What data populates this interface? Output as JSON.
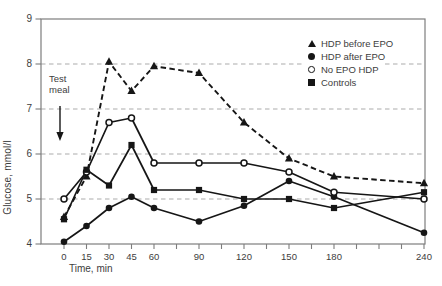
{
  "chart_data": {
    "type": "line",
    "title": "",
    "xlabel": "Time, min",
    "ylabel": "Glucose, mmol/l",
    "xlim": [
      0,
      240
    ],
    "ylim": [
      4,
      9
    ],
    "y_ticks": [
      4,
      5,
      6,
      7,
      8,
      9
    ],
    "x_ticks": {
      "labeled": [
        0,
        15,
        30,
        45,
        60,
        90,
        120,
        150,
        180,
        240
      ],
      "minor": [
        75,
        105,
        135,
        165,
        195,
        210,
        225
      ]
    },
    "gridlines_at": [
      5,
      6,
      7,
      8
    ],
    "grid_style": "dashed",
    "legend_position": "top-right",
    "annotation": {
      "text": "Test meal",
      "arrow": "down"
    },
    "x": [
      0,
      15,
      30,
      45,
      60,
      90,
      120,
      150,
      180,
      240
    ],
    "series": [
      {
        "name": "HDP before EPO",
        "marker": "filled-triangle",
        "line": "dashed",
        "values": [
          4.6,
          5.5,
          8.05,
          7.4,
          7.95,
          7.8,
          6.7,
          5.9,
          5.5,
          5.35
        ]
      },
      {
        "name": "HDP after EPO",
        "marker": "filled-circle",
        "line": "solid",
        "values": [
          4.05,
          4.4,
          4.8,
          5.05,
          4.8,
          4.5,
          4.85,
          5.4,
          5.05,
          4.25
        ]
      },
      {
        "name": "No EPO HDP",
        "marker": "open-circle",
        "line": "solid",
        "values": [
          5.0,
          5.6,
          6.7,
          6.8,
          5.8,
          5.8,
          5.8,
          5.6,
          5.15,
          5.0
        ]
      },
      {
        "name": "Controls",
        "marker": "filled-square",
        "line": "solid",
        "values": [
          4.55,
          5.65,
          5.3,
          6.2,
          5.2,
          5.2,
          5.0,
          5.0,
          4.8,
          5.15
        ]
      }
    ],
    "colors": {
      "series": "#161616",
      "grid": "#ababab",
      "axis": "#7d7d7d",
      "text": "#3d3d3d",
      "background": "#ffffff"
    }
  }
}
